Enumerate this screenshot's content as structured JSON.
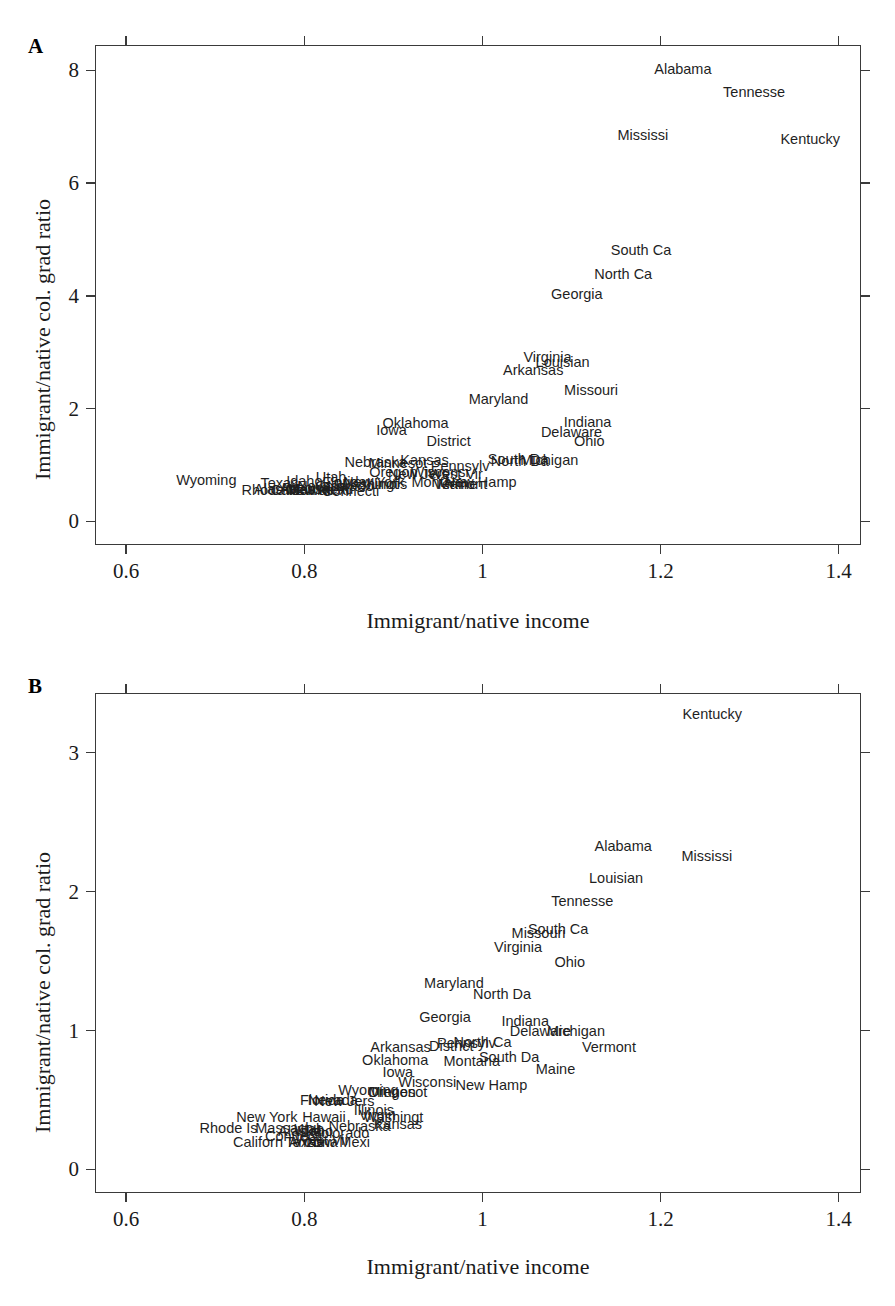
{
  "figure": {
    "width": 895,
    "height": 1306,
    "background": "#ffffff",
    "text_color": "#1a1a1a",
    "frame_color": "#3a3a3a"
  },
  "panels": [
    {
      "letter": "A",
      "xlabel": "Immigrant/native income",
      "ylabel": "Immigrant/native col. grad ratio",
      "xticks": [
        "0.6",
        "0.8",
        "1",
        "1.2",
        "1.4"
      ],
      "yticks": [
        "0",
        "2",
        "4",
        "6",
        "8"
      ]
    },
    {
      "letter": "B",
      "xlabel": "Immigrant/native income",
      "ylabel": "Immigrant/native col. grad ratio",
      "xticks": [
        "0.6",
        "0.8",
        "1",
        "1.2",
        "1.4"
      ],
      "yticks": [
        "0",
        "1",
        "2",
        "3"
      ]
    }
  ],
  "chart_data": [
    {
      "type": "scatter",
      "panel": "A",
      "title": "",
      "xlabel": "Immigrant/native income",
      "ylabel": "Immigrant/native col. grad ratio",
      "xlim": [
        0.565,
        1.425
      ],
      "ylim": [
        -0.42,
        8.45
      ],
      "xticks": [
        0.6,
        0.8,
        1.0,
        1.2,
        1.4
      ],
      "yticks": [
        0,
        2,
        4,
        6,
        8
      ],
      "grid": false,
      "legend": "none",
      "point_style": "text-label",
      "points": [
        {
          "label": "Alabama",
          "x": 1.225,
          "y": 8.03
        },
        {
          "label": "Tennesse",
          "x": 1.305,
          "y": 7.62
        },
        {
          "label": "Mississi",
          "x": 1.18,
          "y": 6.85
        },
        {
          "label": "Kentucky",
          "x": 1.368,
          "y": 6.78
        },
        {
          "label": "South Ca",
          "x": 1.178,
          "y": 4.82
        },
        {
          "label": "North Ca",
          "x": 1.158,
          "y": 4.38
        },
        {
          "label": "Georgia",
          "x": 1.106,
          "y": 4.03
        },
        {
          "label": "Virginia",
          "x": 1.073,
          "y": 2.92
        },
        {
          "label": "Louisian",
          "x": 1.09,
          "y": 2.82
        },
        {
          "label": "Arkansas",
          "x": 1.057,
          "y": 2.68
        },
        {
          "label": "Missouri",
          "x": 1.122,
          "y": 2.33
        },
        {
          "label": "Maryland",
          "x": 1.018,
          "y": 2.17
        },
        {
          "label": "Indiana",
          "x": 1.118,
          "y": 1.76
        },
        {
          "label": "Delaware",
          "x": 1.1,
          "y": 1.58
        },
        {
          "label": "Ohio",
          "x": 1.12,
          "y": 1.42
        },
        {
          "label": "Oklahoma",
          "x": 0.925,
          "y": 1.74
        },
        {
          "label": "Iowa",
          "x": 0.898,
          "y": 1.62
        },
        {
          "label": "District",
          "x": 0.962,
          "y": 1.43
        },
        {
          "label": "South Da",
          "x": 1.04,
          "y": 1.1
        },
        {
          "label": "Michigan",
          "x": 1.075,
          "y": 1.08
        },
        {
          "label": "North Da",
          "x": 1.042,
          "y": 1.07
        },
        {
          "label": "Kansas",
          "x": 0.935,
          "y": 1.09
        },
        {
          "label": "Nebraska",
          "x": 0.88,
          "y": 1.05
        },
        {
          "label": "Minnesot",
          "x": 0.905,
          "y": 1.03
        },
        {
          "label": "Pennsylv",
          "x": 0.975,
          "y": 0.99
        },
        {
          "label": "Oregon",
          "x": 0.9,
          "y": 0.87
        },
        {
          "label": "Wisconsi",
          "x": 0.952,
          "y": 0.87
        },
        {
          "label": "New Jers",
          "x": 0.928,
          "y": 0.84
        },
        {
          "label": "West Vir",
          "x": 0.97,
          "y": 0.84
        },
        {
          "label": "New Hamp",
          "x": 0.998,
          "y": 0.7
        },
        {
          "label": "Montana",
          "x": 0.952,
          "y": 0.69
        },
        {
          "label": "Maine",
          "x": 0.972,
          "y": 0.67
        },
        {
          "label": "Illinois",
          "x": 0.893,
          "y": 0.66
        },
        {
          "label": "Washingt",
          "x": 0.872,
          "y": 0.66
        },
        {
          "label": "Vermont",
          "x": 0.975,
          "y": 0.66
        },
        {
          "label": "Utah",
          "x": 0.83,
          "y": 0.79
        },
        {
          "label": "Florida",
          "x": 0.845,
          "y": 0.69
        },
        {
          "label": "New York",
          "x": 0.878,
          "y": 0.7
        },
        {
          "label": "Idaho",
          "x": 0.8,
          "y": 0.72
        },
        {
          "label": "Texas",
          "x": 0.772,
          "y": 0.68
        },
        {
          "label": "Nevada",
          "x": 0.82,
          "y": 0.63
        },
        {
          "label": "Colorado",
          "x": 0.845,
          "y": 0.62
        },
        {
          "label": "Arizona",
          "x": 0.8,
          "y": 0.6
        },
        {
          "label": "Wyoming",
          "x": 0.69,
          "y": 0.74
        },
        {
          "label": "Rhode Is",
          "x": 0.762,
          "y": 0.55
        },
        {
          "label": "Californ",
          "x": 0.79,
          "y": 0.55
        },
        {
          "label": "Hawaii",
          "x": 0.808,
          "y": 0.56
        },
        {
          "label": "New Mexi",
          "x": 0.815,
          "y": 0.55
        },
        {
          "label": "Connecti",
          "x": 0.852,
          "y": 0.53
        },
        {
          "label": "Alaska",
          "x": 0.768,
          "y": 0.58
        },
        {
          "label": "Massachu",
          "x": 0.818,
          "y": 0.58
        }
      ]
    },
    {
      "type": "scatter",
      "panel": "B",
      "title": "",
      "xlabel": "Immigrant/native income",
      "ylabel": "Immigrant/native col. grad ratio",
      "xlim": [
        0.565,
        1.425
      ],
      "ylim": [
        -0.17,
        3.43
      ],
      "xticks": [
        0.6,
        0.8,
        1.0,
        1.2,
        1.4
      ],
      "yticks": [
        0,
        1,
        2,
        3
      ],
      "grid": false,
      "legend": "none",
      "point_style": "text-label",
      "points": [
        {
          "label": "Kentucky",
          "x": 1.258,
          "y": 3.28
        },
        {
          "label": "Alabama",
          "x": 1.158,
          "y": 2.33
        },
        {
          "label": "Mississi",
          "x": 1.252,
          "y": 2.26
        },
        {
          "label": "Louisian",
          "x": 1.15,
          "y": 2.1
        },
        {
          "label": "Tennesse",
          "x": 1.112,
          "y": 1.93
        },
        {
          "label": "South Ca",
          "x": 1.085,
          "y": 1.73
        },
        {
          "label": "Missouri",
          "x": 1.063,
          "y": 1.7
        },
        {
          "label": "Virginia",
          "x": 1.04,
          "y": 1.6
        },
        {
          "label": "Ohio",
          "x": 1.098,
          "y": 1.49
        },
        {
          "label": "Maryland",
          "x": 0.968,
          "y": 1.34
        },
        {
          "label": "North Da",
          "x": 1.022,
          "y": 1.26
        },
        {
          "label": "Georgia",
          "x": 0.958,
          "y": 1.1
        },
        {
          "label": "Indiana",
          "x": 1.048,
          "y": 1.07
        },
        {
          "label": "Delaware",
          "x": 1.065,
          "y": 1.0
        },
        {
          "label": "Michigan",
          "x": 1.105,
          "y": 1.0
        },
        {
          "label": "North Ca",
          "x": 1.0,
          "y": 0.92
        },
        {
          "label": "Pennsylv",
          "x": 0.982,
          "y": 0.91
        },
        {
          "label": "District",
          "x": 0.965,
          "y": 0.89
        },
        {
          "label": "Arkansas",
          "x": 0.908,
          "y": 0.88
        },
        {
          "label": "Vermont",
          "x": 1.142,
          "y": 0.88
        },
        {
          "label": "South Da",
          "x": 1.03,
          "y": 0.81
        },
        {
          "label": "Oklahoma",
          "x": 0.902,
          "y": 0.79
        },
        {
          "label": "Montana",
          "x": 0.988,
          "y": 0.78
        },
        {
          "label": "Maine",
          "x": 1.082,
          "y": 0.72
        },
        {
          "label": "Iowa",
          "x": 0.905,
          "y": 0.7
        },
        {
          "label": "New Hamp",
          "x": 1.01,
          "y": 0.61
        },
        {
          "label": "Wisconsi",
          "x": 0.938,
          "y": 0.63
        },
        {
          "label": "Wyoming",
          "x": 0.872,
          "y": 0.57
        },
        {
          "label": "Minnesot",
          "x": 0.905,
          "y": 0.56
        },
        {
          "label": "Oregon",
          "x": 0.898,
          "y": 0.56
        },
        {
          "label": "Nevada",
          "x": 0.832,
          "y": 0.5
        },
        {
          "label": "Florida",
          "x": 0.82,
          "y": 0.5
        },
        {
          "label": "New Jers",
          "x": 0.845,
          "y": 0.49
        },
        {
          "label": "Illinois",
          "x": 0.878,
          "y": 0.43
        },
        {
          "label": "Washingt",
          "x": 0.9,
          "y": 0.38
        },
        {
          "label": "Virgin",
          "x": 0.882,
          "y": 0.39
        },
        {
          "label": "New York",
          "x": 0.758,
          "y": 0.38
        },
        {
          "label": "Hawaii",
          "x": 0.822,
          "y": 0.38
        },
        {
          "label": "Kansas",
          "x": 0.905,
          "y": 0.33
        },
        {
          "label": "Nebraska",
          "x": 0.862,
          "y": 0.31
        },
        {
          "label": "Rhode Is",
          "x": 0.715,
          "y": 0.3
        },
        {
          "label": "Massachu",
          "x": 0.782,
          "y": 0.3
        },
        {
          "label": "Utah",
          "x": 0.805,
          "y": 0.29
        },
        {
          "label": "Idaho",
          "x": 0.812,
          "y": 0.28
        },
        {
          "label": "Alaska",
          "x": 0.795,
          "y": 0.28
        },
        {
          "label": "Colorado",
          "x": 0.84,
          "y": 0.26
        },
        {
          "label": "Californ",
          "x": 0.748,
          "y": 0.2
        },
        {
          "label": "Texas",
          "x": 0.8,
          "y": 0.2
        },
        {
          "label": "Arizona",
          "x": 0.81,
          "y": 0.2
        },
        {
          "label": "New Mexi",
          "x": 0.838,
          "y": 0.2
        },
        {
          "label": "West Vir",
          "x": 0.82,
          "y": 0.21
        },
        {
          "label": "Connecti",
          "x": 0.788,
          "y": 0.24
        }
      ]
    }
  ]
}
